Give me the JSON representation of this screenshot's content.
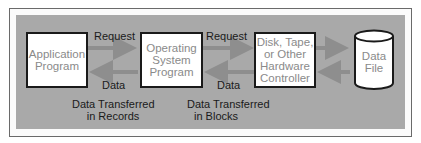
{
  "diagram": {
    "nodes": [
      {
        "id": "app",
        "label_line1": "Application",
        "label_line2": "Program"
      },
      {
        "id": "os",
        "label_line1": "Operating",
        "label_line2": "System",
        "label_line3": "Program"
      },
      {
        "id": "hw",
        "label_line1": "Disk, Tape,",
        "label_line2": "or Other",
        "label_line3": "Hardware",
        "label_line4": "Controller"
      },
      {
        "id": "file",
        "label_line1": "Data",
        "label_line2": "File"
      }
    ],
    "edges": [
      {
        "from": "app",
        "to": "os",
        "label": "Request"
      },
      {
        "from": "os",
        "to": "app",
        "label": "Data"
      },
      {
        "from": "os",
        "to": "hw",
        "label": "Request"
      },
      {
        "from": "hw",
        "to": "os",
        "label": "Data"
      },
      {
        "from": "hw",
        "to": "file",
        "label": ""
      },
      {
        "from": "file",
        "to": "hw",
        "label": ""
      }
    ],
    "captions": {
      "records_line1": "Data Transferred",
      "records_line2": "in Records",
      "blocks_line1": "Data Transferred",
      "blocks_line2": "in Blocks"
    },
    "colors": {
      "panel": "#a9a9a9",
      "arrow": "#8e8e8e",
      "box_text": "#8a8a8a"
    }
  }
}
